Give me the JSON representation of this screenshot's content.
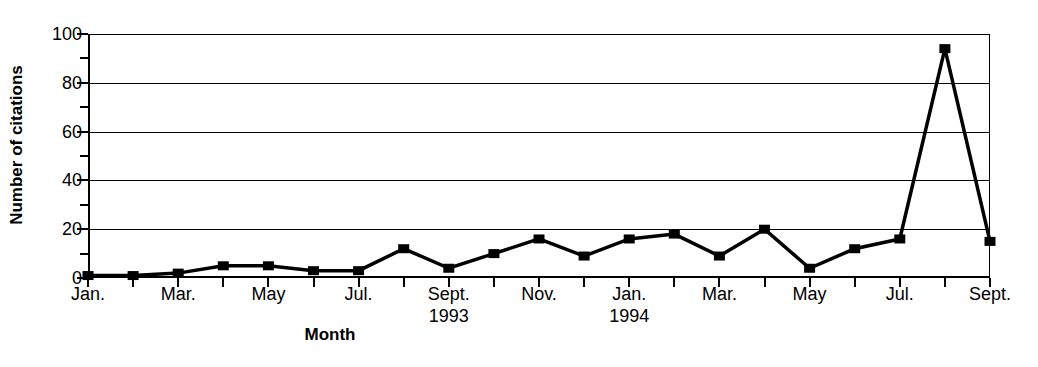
{
  "chart_data": {
    "type": "line",
    "title": "",
    "xlabel": "Month",
    "ylabel": "Number of citations",
    "ylim": [
      0,
      100
    ],
    "yticks_major": [
      0,
      20,
      40,
      60,
      80,
      100
    ],
    "yticks_minor": [
      10,
      30,
      50,
      70,
      90
    ],
    "grid": true,
    "legend": null,
    "marker": "filled-square",
    "categories": [
      "Jan. 1993",
      "Feb. 1993",
      "Mar. 1993",
      "Apr. 1993",
      "May 1993",
      "Jun. 1993",
      "Jul. 1993",
      "Aug. 1993",
      "Sept. 1993",
      "Oct. 1993",
      "Nov. 1993",
      "Dec. 1993",
      "Jan. 1994",
      "Feb. 1994",
      "Mar. 1994",
      "Apr. 1994",
      "May 1994",
      "Jun. 1994",
      "Jul. 1994",
      "Aug. 1994",
      "Sept. 1994"
    ],
    "values": [
      1,
      1,
      2,
      5,
      5,
      3,
      3,
      12,
      4,
      10,
      16,
      9,
      16,
      18,
      9,
      20,
      4,
      12,
      16,
      94,
      15
    ],
    "xtick_labels": [
      {
        "index": 0,
        "label": "Jan.",
        "year": ""
      },
      {
        "index": 2,
        "label": "Mar.",
        "year": ""
      },
      {
        "index": 4,
        "label": "May",
        "year": ""
      },
      {
        "index": 6,
        "label": "Jul.",
        "year": ""
      },
      {
        "index": 8,
        "label": "Sept.",
        "year": "1993"
      },
      {
        "index": 10,
        "label": "Nov.",
        "year": ""
      },
      {
        "index": 12,
        "label": "Jan.",
        "year": "1994"
      },
      {
        "index": 14,
        "label": "Mar.",
        "year": ""
      },
      {
        "index": 16,
        "label": "May",
        "year": ""
      },
      {
        "index": 18,
        "label": "Jul.",
        "year": ""
      },
      {
        "index": 20,
        "label": "Sept.",
        "year": ""
      }
    ],
    "colors": {
      "line": "#000000",
      "marker": "#000000",
      "grid": "#000000",
      "axis": "#000000",
      "background": "#ffffff"
    }
  },
  "axes": {
    "y_title": "Number of citations",
    "x_title": "Month"
  }
}
